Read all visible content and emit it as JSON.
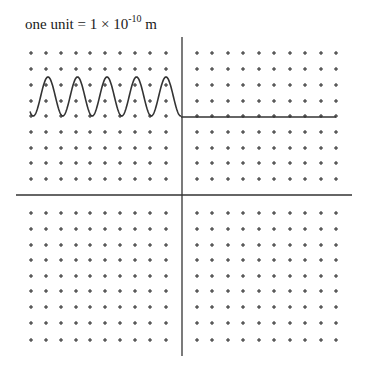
{
  "title": {
    "prefix": "one unit = 1 × 10",
    "exponent": "-10",
    "suffix": " m"
  },
  "diagram": {
    "type": "wavefunction-on-grid",
    "axes": {
      "horizontal": {
        "x1": 16,
        "x2": 352,
        "y": 195
      },
      "vertical": {
        "x": 182,
        "y1": 37,
        "y2": 356
      },
      "color": "#333333"
    },
    "grid": {
      "marker": "+",
      "color": "#222222",
      "columns_left": [
        31,
        46,
        61,
        76,
        90,
        105,
        120,
        135,
        150,
        166
      ],
      "columns_right": [
        197,
        212,
        228,
        243,
        259,
        274,
        290,
        305,
        321,
        336
      ],
      "rows_top": [
        53,
        69,
        85,
        101,
        116,
        132,
        148,
        163,
        179
      ],
      "rows_bottom": [
        213,
        229,
        245,
        260,
        276,
        291,
        307,
        323,
        340
      ]
    },
    "wave": {
      "x_start": 30,
      "x_end": 181,
      "baseline_y": 116,
      "peak_y": 77,
      "periods": 5,
      "peaks_x": [
        48,
        77,
        106,
        135,
        166
      ],
      "color": "#333333"
    },
    "flat_line": {
      "x1": 181,
      "x2": 336,
      "y": 117,
      "color": "#333333"
    }
  }
}
